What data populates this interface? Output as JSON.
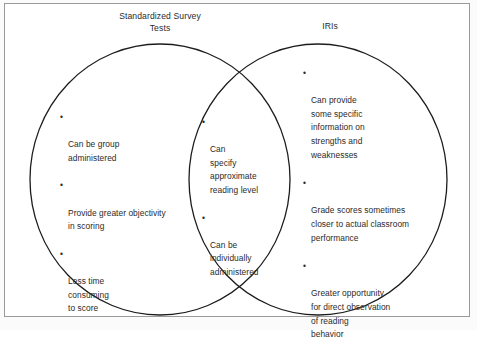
{
  "figure": {
    "type": "venn-diagram",
    "frame_border_color": "#9a9a9a",
    "circle_stroke_color": "#1c1c1c",
    "text_color": "#2b2b2b",
    "background_color": "#ffffff"
  },
  "headers": {
    "left": "Standardized Survey\nTests",
    "right": "IRIs"
  },
  "regions": {
    "left_only": {
      "name": "Standardized Survey Tests only",
      "bullet_marker": "•",
      "bullets": [
        "Can be group\nadministered",
        "Provide greater objectivity\nin scoring",
        "Less time\nconsuming\nto score"
      ]
    },
    "overlap": {
      "name": "Shared by both",
      "bullet_marker": "•",
      "bullets": [
        "Can\nspecify\napproximate\nreading level",
        "Can be\nindividually\nadministered"
      ]
    },
    "right_only": {
      "name": "IRIs only",
      "bullet_marker": "•",
      "bullets": [
        "Can provide\nsome specific\ninformation on\nstrengths and\nweaknesses",
        "Grade scores sometimes\ncloser to actual classroom\nperformance",
        "Greater opportunity\nfor direct observation\nof reading\nbehavior"
      ]
    }
  }
}
